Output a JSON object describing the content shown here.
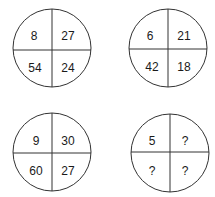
{
  "puzzle": {
    "circles": [
      {
        "id": "top-left",
        "cells": {
          "top_left": "8",
          "top_right": "27",
          "bottom_left": "54",
          "bottom_right": "24"
        }
      },
      {
        "id": "top-right",
        "cells": {
          "top_left": "6",
          "top_right": "21",
          "bottom_left": "42",
          "bottom_right": "18"
        }
      },
      {
        "id": "bottom-left",
        "cells": {
          "top_left": "9",
          "top_right": "30",
          "bottom_left": "60",
          "bottom_right": "27"
        }
      },
      {
        "id": "bottom-right",
        "cells": {
          "top_left": "5",
          "top_right": "?",
          "bottom_left": "?",
          "bottom_right": "?"
        }
      }
    ]
  }
}
